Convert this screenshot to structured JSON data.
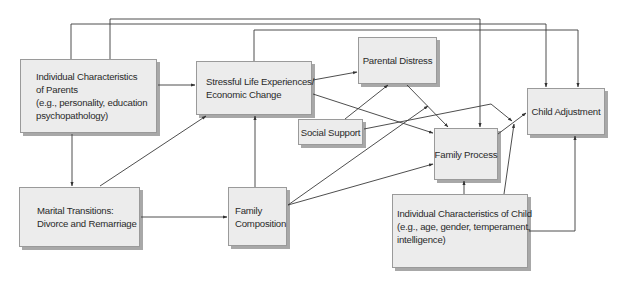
{
  "diagram": {
    "nodes": {
      "parents": {
        "lines": [
          "Individual Characteristics",
          "of Parents",
          "(e.g., personality, education",
          "psychopathology)"
        ]
      },
      "stressful": {
        "lines": [
          "Stressful Life Experiences/",
          "Economic Change"
        ]
      },
      "parental_distress": {
        "lines": [
          "Parental Distress"
        ]
      },
      "social_support": {
        "lines": [
          "Social Support"
        ]
      },
      "child_adjustment": {
        "lines": [
          "Child Adjustment"
        ]
      },
      "family_process": {
        "lines": [
          "Family Process"
        ]
      },
      "marital": {
        "lines": [
          "Marital Transitions:",
          "Divorce and Remarriage"
        ]
      },
      "family_composition": {
        "lines": [
          "Family",
          "Composition"
        ]
      },
      "child_characteristics": {
        "lines": [
          "Individual Characteristics of Child",
          "(e.g., age, gender, temperament,",
          "intelligence)"
        ]
      }
    },
    "edges": [
      {
        "from": "Individual Characteristics of Parents",
        "to": "Stressful Life Experiences/Economic Change"
      },
      {
        "from": "Individual Characteristics of Parents",
        "to": "Marital Transitions"
      },
      {
        "from": "Individual Characteristics of Parents",
        "to": "Family Process"
      },
      {
        "from": "Individual Characteristics of Parents",
        "to": "Child Adjustment"
      },
      {
        "from": "Stressful Life Experiences/Economic Change",
        "to": "Child Adjustment"
      },
      {
        "from": "Stressful Life Experiences/Economic Change",
        "to": "Parental Distress"
      },
      {
        "from": "Stressful Life Experiences/Economic Change",
        "to": "Family Process"
      },
      {
        "from": "Social Support",
        "to": "Parental Distress"
      },
      {
        "from": "Social Support",
        "to": "Child Adjustment"
      },
      {
        "from": "Parental Distress",
        "to": "Family Process"
      },
      {
        "from": "Marital Transitions",
        "to": "Stressful Life Experiences/Economic Change"
      },
      {
        "from": "Marital Transitions",
        "to": "Family Composition"
      },
      {
        "from": "Family Composition",
        "to": "Stressful Life Experiences/Economic Change"
      },
      {
        "from": "Family Composition",
        "to": "Parental Distress"
      },
      {
        "from": "Family Composition",
        "to": "Family Process"
      },
      {
        "from": "Family Process",
        "to": "Child Adjustment"
      },
      {
        "from": "Individual Characteristics of Child",
        "to": "Family Process"
      },
      {
        "from": "Individual Characteristics of Child",
        "to": "Child Adjustment"
      }
    ]
  }
}
